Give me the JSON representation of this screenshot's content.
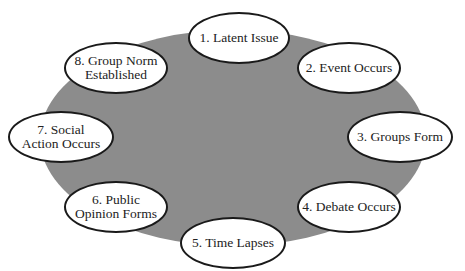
{
  "diagram": {
    "type": "cycle",
    "background_ellipse_color": "#8c8c8c",
    "nodes": [
      {
        "label": "1. Latent Issue"
      },
      {
        "label": "2. Event Occurs"
      },
      {
        "label": "3. Groups Form"
      },
      {
        "label": "4. Debate Occurs"
      },
      {
        "label": "5. Time Lapses"
      },
      {
        "label": "6. Public\nOpinion Forms"
      },
      {
        "label": "7. Social\nAction Occurs"
      },
      {
        "label": "8. Group Norm\nEstablished"
      }
    ]
  }
}
